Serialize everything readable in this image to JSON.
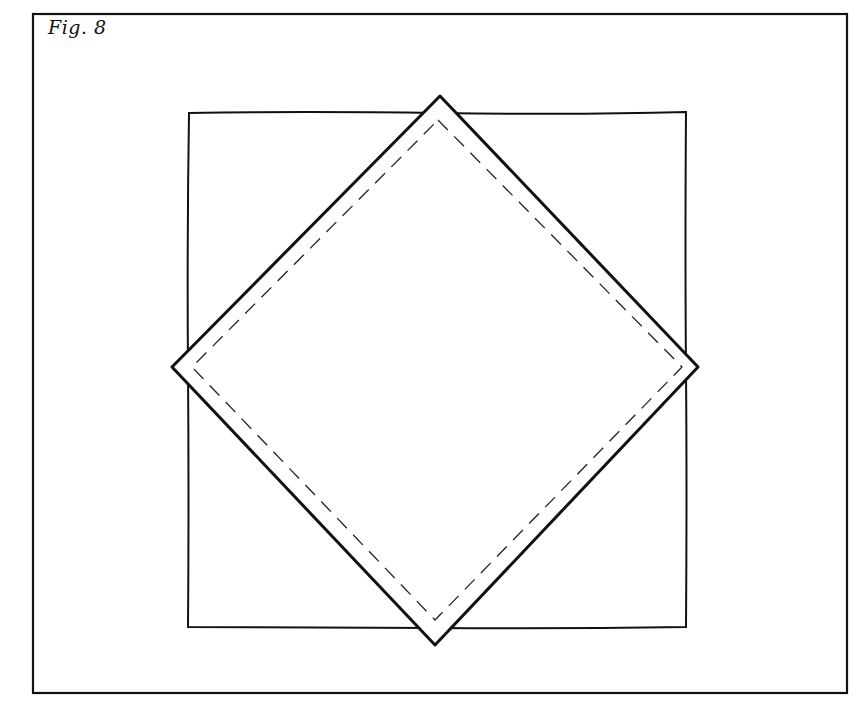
{
  "figure": {
    "label": "Fig. 8",
    "line_color": "#111111",
    "background": "#ffffff",
    "frame": {
      "x": 33,
      "y": 14,
      "width": 814,
      "height": 679
    },
    "square": {
      "x": 188,
      "y": 112,
      "width": 498,
      "height": 516
    },
    "diamond_outer": {
      "top": [
        440,
        96
      ],
      "right": [
        698,
        367
      ],
      "bottom": [
        435,
        645
      ],
      "left": [
        172,
        367
      ]
    },
    "diamond_inner_dashed": {
      "top": [
        438,
        120
      ],
      "right": [
        682,
        367
      ],
      "bottom": [
        435,
        620
      ],
      "left": [
        192,
        367
      ]
    }
  }
}
